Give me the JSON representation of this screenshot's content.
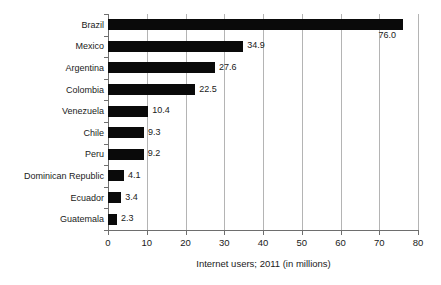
{
  "chart_data": {
    "type": "bar",
    "orientation": "horizontal",
    "title": "",
    "subtitle": "",
    "xlabel": "Internet users; 2011 (in millions)",
    "ylabel": "",
    "categories": [
      "Brazil",
      "Mexico",
      "Argentina",
      "Colombia",
      "Venezuela",
      "Chile",
      "Peru",
      "Dominican Republic",
      "Ecuador",
      "Guatemala"
    ],
    "values": [
      76.0,
      34.9,
      27.6,
      22.5,
      10.4,
      9.3,
      9.2,
      4.1,
      3.4,
      2.3
    ],
    "value_labels": [
      "76.0",
      "34.9",
      "27.6",
      "22.5",
      "10.4",
      "9.3",
      "9.2",
      "4.1",
      "3.4",
      "2.3"
    ],
    "xlim": [
      0,
      80
    ],
    "ylim": null,
    "xticks": [
      0,
      10,
      20,
      30,
      40,
      50,
      60,
      70,
      80
    ],
    "xtick_labels": [
      "0",
      "10",
      "20",
      "30",
      "40",
      "50",
      "60",
      "70",
      "80"
    ],
    "grid": true,
    "grid_axis": "x",
    "legend": false,
    "legend_position": "none",
    "bar_color": "#0a0a0a",
    "gridline_color": "#b4b4b4",
    "axis_color": "#6e6e6e",
    "background_color": "#ffffff",
    "annotations": []
  }
}
